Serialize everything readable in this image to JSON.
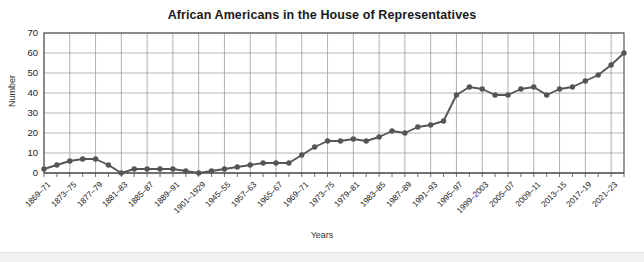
{
  "chart_data": {
    "type": "line",
    "title": "African Americans in the House of Representatives",
    "xlabel": "Years",
    "ylabel": "Number",
    "ylim": [
      0,
      70
    ],
    "ytick_step": 10,
    "yticks": [
      0,
      10,
      20,
      30,
      40,
      50,
      60,
      70
    ],
    "grid": true,
    "legend": "none",
    "marker": "circle",
    "line_color": "#555555",
    "marker_color": "#555555",
    "categories": [
      "1869–71",
      "1871–73",
      "1873–75",
      "1875–77",
      "1877–79",
      "1879–81",
      "1881–83",
      "1883–85",
      "1885–87",
      "1887–89",
      "1889–91",
      "1891–93",
      "1901–1929",
      "1929–1945",
      "1945–55",
      "1955–57",
      "1957–63",
      "1963–65",
      "1965–67",
      "1967–69",
      "1969–71",
      "1971–73",
      "1973–75",
      "1975–77",
      "1977–79",
      "1979–81",
      "1981–83",
      "1983–85",
      "1985–87",
      "1987–89",
      "1989–91",
      "1991–93",
      "1993–95",
      "1995–97",
      "1997–99",
      "1999–2003",
      "2003–05",
      "2005–07",
      "2007–09",
      "2009–11",
      "2011–13",
      "2013–15",
      "2015–17",
      "2017–19",
      "2019–21",
      "2021–23"
    ],
    "tick_labels": [
      "1869–71",
      "1873–75",
      "1877–79",
      "1881–83",
      "1885–87",
      "1889–91",
      "1901–1929",
      "1945–55",
      "1957–63",
      "1965–67",
      "1969–71",
      "1973–75",
      "1979–81",
      "1983–85",
      "1987–89",
      "1991–93",
      "1995–97",
      "1999–2003",
      "2005–07",
      "2009–11",
      "2013–15",
      "2017–19",
      "2021–23"
    ],
    "values": [
      2,
      4,
      6,
      7,
      7,
      4,
      0,
      2,
      2,
      2,
      2,
      1,
      0,
      1,
      2,
      3,
      4,
      5,
      5,
      5,
      9,
      13,
      16,
      16,
      17,
      16,
      18,
      21,
      20,
      23,
      24,
      26,
      39,
      43,
      42,
      39,
      39,
      42,
      43,
      39,
      42,
      43,
      46,
      49,
      54,
      60
    ]
  }
}
